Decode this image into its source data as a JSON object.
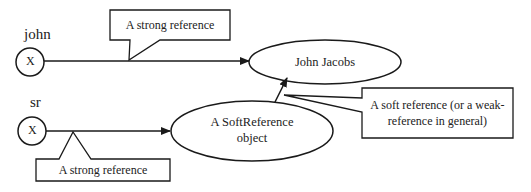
{
  "diagram": {
    "variables": [
      {
        "id": "john",
        "name": "john",
        "glyph": "X"
      },
      {
        "id": "sr",
        "name": "sr",
        "glyph": "X"
      }
    ],
    "nodes": [
      {
        "id": "john-jacobs",
        "label": "John Jacobs"
      },
      {
        "id": "soft-reference-object",
        "label_line1": "A SoftReference",
        "label_line2": "object"
      }
    ],
    "edges": [
      {
        "from": "john",
        "to": "john-jacobs",
        "kind": "strong"
      },
      {
        "from": "sr",
        "to": "soft-reference-object",
        "kind": "strong"
      },
      {
        "from": "soft-reference-object",
        "to": "john-jacobs",
        "kind": "soft"
      }
    ],
    "callouts": {
      "top_strong": "A strong reference",
      "bottom_strong": "A strong reference",
      "soft_line1": "A soft reference (or a weak-",
      "soft_line2": "reference in general)"
    },
    "colors": {
      "stroke": "#1a1a1a",
      "background": "#ffffff",
      "text": "#222222"
    }
  }
}
